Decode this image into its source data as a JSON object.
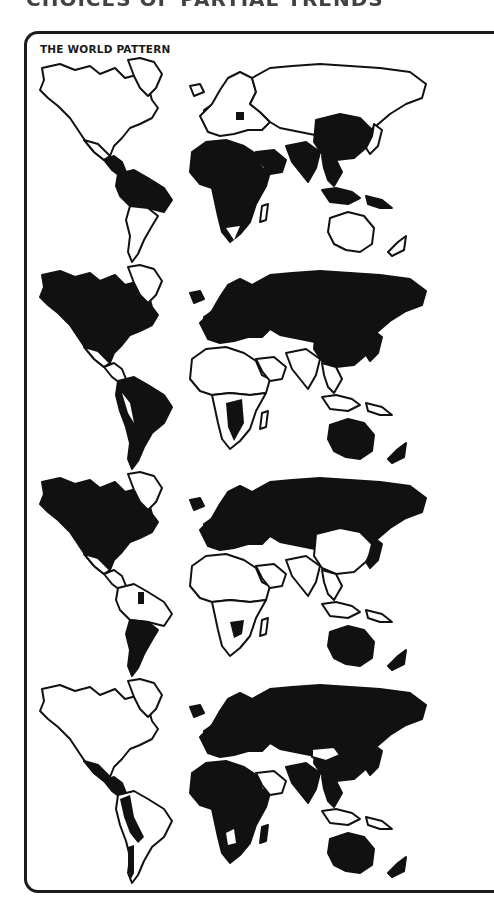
{
  "header": {
    "clipped_heading": "CHOICES OF PARTIAL TRENDS"
  },
  "figure": {
    "title": "THE WORLD PATTERN",
    "colors": {
      "ink": "#111111",
      "paper": "#ffffff",
      "frame": "#1c1c1c"
    },
    "panels": [
      {
        "id": "map-1",
        "shaded_regions": [
          "central-america",
          "northern-south-america",
          "brazil",
          "africa-sub-saharan",
          "arabia",
          "south-asia",
          "china",
          "southeast-asia",
          "indonesia",
          "eastern-europe-patch"
        ],
        "unshaded_regions": [
          "north-america",
          "southern-south-america",
          "europe",
          "russia",
          "australia",
          "new-zealand",
          "japan",
          "greenland",
          "southern-africa"
        ]
      },
      {
        "id": "map-2",
        "shaded_regions": [
          "north-america",
          "south-america",
          "europe",
          "russia",
          "china",
          "japan",
          "australia",
          "new-zealand",
          "central-africa",
          "southeast-asia-islands"
        ],
        "unshaded_regions": [
          "greenland-outline",
          "mexico",
          "central-america",
          "north-africa",
          "middle-east",
          "south-asia",
          "southeast-asia-mainland"
        ]
      },
      {
        "id": "map-3",
        "shaded_regions": [
          "north-america-canada-usa",
          "russia",
          "europe",
          "australia",
          "new-zealand",
          "argentina",
          "central-africa-patch",
          "venezuela-patch"
        ],
        "unshaded_regions": [
          "mexico",
          "central-america",
          "south-america-north",
          "africa",
          "middle-east",
          "south-asia",
          "china",
          "southeast-asia"
        ]
      },
      {
        "id": "map-4",
        "shaded_regions": [
          "mexico-central-america",
          "andes",
          "africa",
          "europe",
          "russia",
          "china",
          "south-asia",
          "southeast-asia",
          "australia",
          "new-zealand",
          "japan"
        ],
        "unshaded_regions": [
          "north-america",
          "brazil",
          "arabian-peninsula",
          "mongolia",
          "greenland"
        ]
      }
    ]
  }
}
